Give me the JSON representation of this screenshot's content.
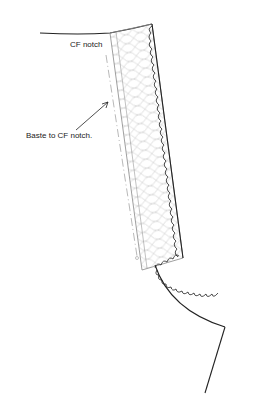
{
  "diagram": {
    "labels": {
      "cf_notch": "CF notch",
      "baste": "Baste to CF notch."
    },
    "colors": {
      "outline": "#222222",
      "interfacing": "#bdbdbd",
      "band_edge": "#888888"
    }
  }
}
